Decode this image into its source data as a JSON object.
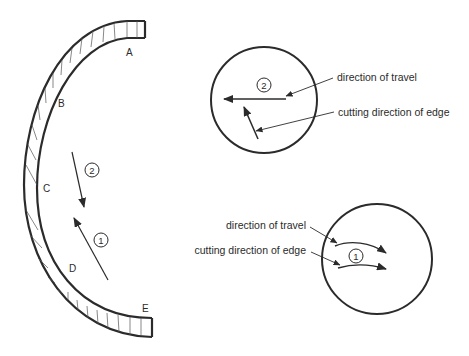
{
  "diagram": {
    "colors": {
      "ink": "#2b2b2b",
      "hatch": "#555555",
      "background": "#ffffff"
    },
    "blade_section": {
      "point_labels": [
        "A",
        "B",
        "C",
        "D",
        "E"
      ],
      "motions": [
        {
          "id": "1",
          "label": "1",
          "direction": "up-left"
        },
        {
          "id": "2",
          "label": "2",
          "direction": "down"
        }
      ]
    },
    "detail_top": {
      "motion_label": "2",
      "callouts": {
        "travel": "direction of travel",
        "cutting": "cutting direction of edge"
      }
    },
    "detail_bottom": {
      "motion_label": "1",
      "callouts": {
        "travel": "direction of travel",
        "cutting": "cutting direction of edge"
      }
    }
  }
}
